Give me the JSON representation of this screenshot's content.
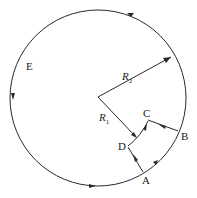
{
  "diagram": {
    "type": "closed circuit path on circle",
    "colors": {
      "line": "#2a2a2a",
      "background": "#ffffff"
    },
    "labels": {
      "A": "A",
      "B": "B",
      "C": "C",
      "D": "D",
      "E": "E",
      "R1": "R",
      "R1_sub": "1",
      "R2": "R",
      "R2_sub": "2"
    },
    "geometry": {
      "outer_circle": {
        "cx": 98,
        "cy": 98,
        "r": 88
      },
      "center": [
        98,
        97
      ],
      "points": {
        "A": [
          143,
          172
        ],
        "B": [
          178,
          131
        ],
        "C": [
          148,
          120
        ],
        "D": [
          128,
          145
        ]
      }
    }
  }
}
